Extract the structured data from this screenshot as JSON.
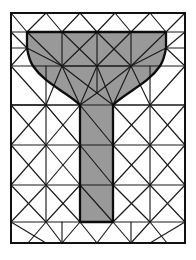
{
  "figure": {
    "type": "mesh-diagram",
    "width": 196,
    "height": 260,
    "background_color": "#ffffff"
  },
  "colors": {
    "background": "#ffffff",
    "inner_region_fill": "#999999",
    "outer_region_fill": "#ffffff",
    "mesh_edge": "#1a1a1a",
    "outer_boundary": "#111111",
    "feature_boundary": "#0d0d0d"
  },
  "geometry": {
    "outer_rectangle": {
      "x0": 11,
      "y0": 13,
      "x1": 185,
      "y1": 243
    },
    "t_shape": {
      "description": "T-shaped inner subdomain with filleted re-entrant corners",
      "flange_top_y": 32,
      "flange_left_x": 27,
      "flange_right_x": 166,
      "stem_left_x": 80,
      "stem_right_x": 113,
      "stem_bottom_y": 222,
      "fillet_start_y": 66,
      "fillet_end_y": 105,
      "fillet_radius": 40
    }
  },
  "mesh": {
    "element_type": "triangle",
    "edge_count_label": "",
    "node_count_label": ""
  },
  "outer_boundary_path": "M11,13 L185,13 L185,243 L11,243 Z",
  "feature_boundary_path": "M27,32 L166,32 L166,48 C166,48 164,60 160,66 C148,84 126,92 113,105 L113,222 L80,222 L80,105 C67,92 45,84 33,66 C29,60 27,48 27,48 Z",
  "inner_region_path": "M27,32 L166,32 L166,48 C166,48 164,60 160,66 C148,84 126,92 113,105 L113,222 L80,222 L80,105 C67,92 45,84 33,66 C29,60 27,48 27,48 Z",
  "mesh_edges": [
    {
      "d": "M11,13 L185,13"
    },
    {
      "d": "M185,13 L185,243"
    },
    {
      "d": "M185,243 L11,243"
    },
    {
      "d": "M11,243 L11,13"
    },
    {
      "d": "M11,32 L185,32"
    },
    {
      "d": "M11,13 L27,32"
    },
    {
      "d": "M27,32 L46,13"
    },
    {
      "d": "M46,13 L62,32"
    },
    {
      "d": "M62,32 L80,13"
    },
    {
      "d": "M80,13 L97,32"
    },
    {
      "d": "M97,32 L115,13"
    },
    {
      "d": "M115,13 L131,32"
    },
    {
      "d": "M131,32 L150,13"
    },
    {
      "d": "M150,13 L166,32"
    },
    {
      "d": "M166,32 L185,13"
    },
    {
      "d": "M11,13 L11,32"
    },
    {
      "d": "M185,13 L185,32"
    },
    {
      "d": "M27,32 L27,48"
    },
    {
      "d": "M62,32 L62,66"
    },
    {
      "d": "M97,32 L97,66"
    },
    {
      "d": "M131,32 L131,66"
    },
    {
      "d": "M166,32 L166,48"
    },
    {
      "d": "M27,32 L62,66"
    },
    {
      "d": "M62,32 L97,66"
    },
    {
      "d": "M97,32 L62,66"
    },
    {
      "d": "M131,32 L97,66"
    },
    {
      "d": "M97,32 L131,66"
    },
    {
      "d": "M166,32 L131,66"
    },
    {
      "d": "M27,48 L62,66"
    },
    {
      "d": "M166,48 L131,66"
    },
    {
      "d": "M62,66 L97,66"
    },
    {
      "d": "M97,66 L131,66"
    },
    {
      "d": "M62,66 L80,105"
    },
    {
      "d": "M97,66 L80,105"
    },
    {
      "d": "M97,66 L113,105"
    },
    {
      "d": "M131,66 L113,105"
    },
    {
      "d": "M97,66 L97,93"
    },
    {
      "d": "M80,105 L113,105"
    },
    {
      "d": "M97,93 L80,105"
    },
    {
      "d": "M97,93 L113,105"
    },
    {
      "d": "M62,66 L97,93"
    },
    {
      "d": "M131,66 L97,93"
    },
    {
      "d": "M11,32 L11,66"
    },
    {
      "d": "M185,32 L185,66"
    },
    {
      "d": "M11,66 L185,66"
    },
    {
      "d": "M11,32 L27,48"
    },
    {
      "d": "M185,32 L166,48"
    },
    {
      "d": "M11,66 L27,48"
    },
    {
      "d": "M185,66 L166,48"
    },
    {
      "d": "M11,32 L11,48"
    },
    {
      "d": "M11,48 L27,48"
    },
    {
      "d": "M185,48 L166,48"
    },
    {
      "d": "M11,48 L11,66"
    },
    {
      "d": "M185,32 L185,48"
    },
    {
      "d": "M185,48 L185,66"
    },
    {
      "d": "M11,66 L46,105"
    },
    {
      "d": "M46,105 L80,105"
    },
    {
      "d": "M46,105 L62,66"
    },
    {
      "d": "M46,105 L11,105"
    },
    {
      "d": "M11,66 L11,105"
    },
    {
      "d": "M11,105 L46,105"
    },
    {
      "d": "M46,66 L46,105"
    },
    {
      "d": "M185,66 L150,105"
    },
    {
      "d": "M150,105 L113,105"
    },
    {
      "d": "M150,105 L131,66"
    },
    {
      "d": "M150,105 L185,105"
    },
    {
      "d": "M185,66 L185,105"
    },
    {
      "d": "M150,66 L150,105"
    },
    {
      "d": "M11,105 L80,105"
    },
    {
      "d": "M113,105 L185,105"
    },
    {
      "d": "M11,105 L11,145"
    },
    {
      "d": "M46,105 L46,145"
    },
    {
      "d": "M11,145 L46,145"
    },
    {
      "d": "M11,105 L46,145"
    },
    {
      "d": "M46,105 L11,145"
    },
    {
      "d": "M46,105 L80,145"
    },
    {
      "d": "M46,145 L80,145"
    },
    {
      "d": "M80,105 L80,145"
    },
    {
      "d": "M46,105 L80,145"
    },
    {
      "d": "M80,105 L46,145"
    },
    {
      "d": "M113,105 L113,145"
    },
    {
      "d": "M113,145 L150,145"
    },
    {
      "d": "M150,105 L150,145"
    },
    {
      "d": "M113,105 L150,145"
    },
    {
      "d": "M150,105 L113,145"
    },
    {
      "d": "M150,105 L185,145"
    },
    {
      "d": "M150,145 L185,145"
    },
    {
      "d": "M185,105 L185,145"
    },
    {
      "d": "M185,105 L150,145"
    },
    {
      "d": "M80,105 L113,145"
    },
    {
      "d": "M80,145 L113,145"
    },
    {
      "d": "M11,145 L11,185"
    },
    {
      "d": "M46,145 L46,185"
    },
    {
      "d": "M11,185 L46,185"
    },
    {
      "d": "M11,145 L46,185"
    },
    {
      "d": "M46,145 L11,185"
    },
    {
      "d": "M46,145 L80,185"
    },
    {
      "d": "M80,145 L80,185"
    },
    {
      "d": "M46,185 L80,185"
    },
    {
      "d": "M80,145 L46,185"
    },
    {
      "d": "M113,145 L113,185"
    },
    {
      "d": "M113,185 L150,185"
    },
    {
      "d": "M150,145 L150,185"
    },
    {
      "d": "M113,145 L150,185"
    },
    {
      "d": "M150,145 L113,185"
    },
    {
      "d": "M150,145 L185,185"
    },
    {
      "d": "M150,185 L185,185"
    },
    {
      "d": "M185,145 L185,185"
    },
    {
      "d": "M185,145 L150,185"
    },
    {
      "d": "M80,145 L113,185"
    },
    {
      "d": "M80,185 L113,185"
    },
    {
      "d": "M11,185 L11,222"
    },
    {
      "d": "M46,185 L46,222"
    },
    {
      "d": "M11,222 L46,222"
    },
    {
      "d": "M11,185 L46,222"
    },
    {
      "d": "M46,185 L11,222"
    },
    {
      "d": "M46,185 L80,222"
    },
    {
      "d": "M80,185 L80,222"
    },
    {
      "d": "M46,222 L80,222"
    },
    {
      "d": "M80,185 L46,222"
    },
    {
      "d": "M113,185 L113,222"
    },
    {
      "d": "M113,222 L150,222"
    },
    {
      "d": "M150,185 L150,222"
    },
    {
      "d": "M113,185 L150,222"
    },
    {
      "d": "M150,185 L113,222"
    },
    {
      "d": "M150,185 L185,222"
    },
    {
      "d": "M150,222 L185,222"
    },
    {
      "d": "M185,185 L185,222"
    },
    {
      "d": "M185,185 L150,222"
    },
    {
      "d": "M80,185 L113,222"
    },
    {
      "d": "M80,222 L113,222"
    },
    {
      "d": "M11,222 L11,243"
    },
    {
      "d": "M185,222 L185,243"
    },
    {
      "d": "M11,222 L46,243"
    },
    {
      "d": "M46,222 L62,243"
    },
    {
      "d": "M46,222 L28,243"
    },
    {
      "d": "M80,222 L62,243"
    },
    {
      "d": "M80,222 L97,243"
    },
    {
      "d": "M113,222 L97,243"
    },
    {
      "d": "M113,222 L131,243"
    },
    {
      "d": "M150,222 L131,243"
    },
    {
      "d": "M150,222 L167,243"
    },
    {
      "d": "M185,222 L150,243"
    },
    {
      "d": "M62,222 L62,243"
    },
    {
      "d": "M131,222 L131,243"
    }
  ]
}
